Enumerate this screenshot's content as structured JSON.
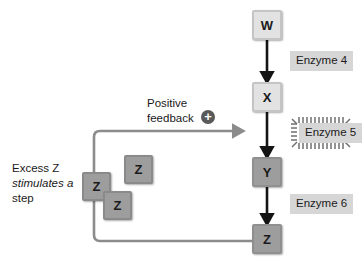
{
  "figure": {
    "background_color": "#ffffff"
  },
  "pathway": {
    "nodes": [
      {
        "id": "w",
        "label": "W",
        "shade": "light",
        "x": 252,
        "y": 10
      },
      {
        "id": "x",
        "label": "X",
        "shade": "light",
        "x": 252,
        "y": 82
      },
      {
        "id": "y",
        "label": "Y",
        "shade": "dark",
        "x": 252,
        "y": 157
      },
      {
        "id": "z",
        "label": "Z",
        "shade": "dark",
        "x": 252,
        "y": 224
      }
    ],
    "arrows": [
      {
        "from": "W",
        "to": "X"
      },
      {
        "from": "X",
        "to": "Y"
      },
      {
        "from": "Y",
        "to": "Z"
      }
    ],
    "arrow_color": "#141414"
  },
  "enzymes": [
    {
      "id": "enzyme4",
      "label": "Enzyme 4",
      "activated": false
    },
    {
      "id": "enzyme5",
      "label": "Enzyme 5",
      "activated": true
    },
    {
      "id": "enzyme6",
      "label": "Enzyme 6",
      "activated": false
    }
  ],
  "enzyme_label_color": "#d6d6d6",
  "feedback": {
    "title_line1": "Positive",
    "title_line2": "feedback",
    "sign_icon": "plus-circle-icon",
    "sign_symbol": "+",
    "sign_color": "#595959",
    "line_color": "#8c8c8c",
    "target": "Enzyme 5",
    "source": "Z"
  },
  "annotation": {
    "line1": "Excess Z",
    "line2": "stimulates a",
    "line2_style": "italic",
    "line3": "step"
  },
  "z_cluster": {
    "label": "Z",
    "chips": [
      {
        "id": "z-chip-upper-right",
        "x": 124,
        "y": 155
      },
      {
        "id": "z-chip-left",
        "x": 82,
        "y": 172
      },
      {
        "id": "z-chip-lower",
        "x": 103,
        "y": 191
      }
    ]
  }
}
